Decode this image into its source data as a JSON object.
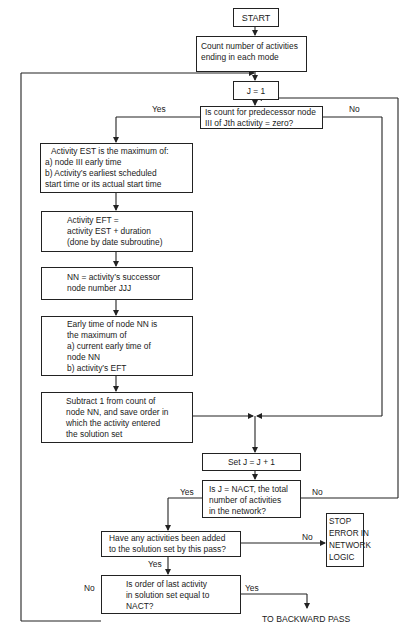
{
  "flowchart": {
    "start": "START",
    "count": [
      "Count number of activities",
      "ending in each mode"
    ],
    "j_init": "J = 1",
    "decision_pred": [
      "Is count for predecessor node",
      "III of Jth activity = zero?"
    ],
    "est": [
      "Activity EST is the maximum of:",
      "a)  node III early time",
      "b)  Activity’s earliest scheduled",
      "start time or its actual start time"
    ],
    "eft": [
      "Activity EFT =",
      "activity EST + duration",
      "(done by date subroutine)"
    ],
    "nn": [
      "NN = activity’s successor",
      "node number JJJ"
    ],
    "early_time": [
      "Early time of node NN is",
      "the maximum of",
      "a)  current early time of",
      "node NN",
      "b) activity’s EFT"
    ],
    "subtract": [
      "Subtract 1 from count of",
      "node NN, and save order in",
      "which the activity entered",
      "the solution set"
    ],
    "set_j": "Set J = J + 1",
    "decision_nact": [
      "Is J = NACT, the total",
      "number of activities",
      "in the network?"
    ],
    "decision_added": [
      "Have any activities been added",
      "to the solution set by this pass?"
    ],
    "stop": [
      "STOP",
      "ERROR IN",
      "NETWORK",
      "LOGIC"
    ],
    "decision_order": [
      "Is order of last activity",
      "in solution set equal to",
      "NACT?"
    ],
    "end_label": "TO BACKWARD PASS",
    "labels": {
      "yes": "Yes",
      "no": "No"
    }
  }
}
